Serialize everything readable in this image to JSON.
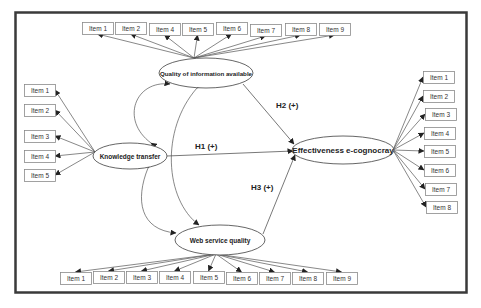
{
  "diagram": {
    "constructs": {
      "quality": {
        "label": "Quality of information available",
        "cx": 206,
        "cy": 73,
        "rx": 47,
        "ry": 15,
        "font_size": 6.2
      },
      "knowledge": {
        "label": "Knowledge transfer",
        "cx": 130,
        "cy": 156,
        "rx": 37,
        "ry": 13,
        "font_size": 6.5
      },
      "effectiveness": {
        "label": "Effectiveness e-cognocray",
        "cx": 343,
        "cy": 150,
        "rx": 51,
        "ry": 14,
        "font_size": 8
      },
      "web": {
        "label": "Web service quality",
        "cx": 220,
        "cy": 240,
        "rx": 45,
        "ry": 15,
        "font_size": 6.5
      }
    },
    "hypotheses": [
      {
        "id": "H1",
        "label": "H1 (+)",
        "lx": 195,
        "ly": 149
      },
      {
        "id": "H2",
        "label": "H2 (+)",
        "lx": 276,
        "ly": 108
      },
      {
        "id": "H3",
        "label": "H3 (+)",
        "lx": 251,
        "ly": 190
      }
    ],
    "quality_items": [
      {
        "label": "Item 1",
        "x": 82,
        "y": 22
      },
      {
        "label": "Item 2",
        "x": 115,
        "y": 22
      },
      {
        "label": "Item 4",
        "x": 149,
        "y": 23
      },
      {
        "label": "Item 5",
        "x": 182,
        "y": 23
      },
      {
        "label": "Item 6",
        "x": 216,
        "y": 22
      },
      {
        "label": "Item 7",
        "x": 250,
        "y": 24
      },
      {
        "label": "Item 8",
        "x": 285,
        "y": 23
      },
      {
        "label": "Item 9",
        "x": 319,
        "y": 23
      }
    ],
    "knowledge_items": [
      {
        "label": "Item 1",
        "x": 24,
        "y": 84
      },
      {
        "label": "Item 2",
        "x": 24,
        "y": 104
      },
      {
        "label": "Item 3",
        "x": 24,
        "y": 130
      },
      {
        "label": "Item 4",
        "x": 24,
        "y": 150
      },
      {
        "label": "Item 5",
        "x": 24,
        "y": 169
      }
    ],
    "effectiveness_items": [
      {
        "label": "Item 1",
        "x": 423,
        "y": 71
      },
      {
        "label": "Item 2",
        "x": 423,
        "y": 90
      },
      {
        "label": "Item 3",
        "x": 425,
        "y": 108
      },
      {
        "label": "Item 4",
        "x": 424,
        "y": 127
      },
      {
        "label": "Item 5",
        "x": 424,
        "y": 145
      },
      {
        "label": "Item 6",
        "x": 424,
        "y": 164
      },
      {
        "label": "Item 7",
        "x": 425,
        "y": 183
      },
      {
        "label": "Item 8",
        "x": 426,
        "y": 201
      }
    ],
    "web_items": [
      {
        "label": "Item 1",
        "x": 60,
        "y": 272
      },
      {
        "label": "Item 2",
        "x": 93,
        "y": 271
      },
      {
        "label": "Item 3",
        "x": 126,
        "y": 271
      },
      {
        "label": "Item 4",
        "x": 159,
        "y": 271
      },
      {
        "label": "Item 5",
        "x": 193,
        "y": 271
      },
      {
        "label": "Item 6",
        "x": 226,
        "y": 272
      },
      {
        "label": "Item 7",
        "x": 259,
        "y": 272
      },
      {
        "label": "Item 8",
        "x": 292,
        "y": 272
      },
      {
        "label": "Item 9",
        "x": 326,
        "y": 272
      }
    ],
    "colors": {
      "frame": "#3a3a3a",
      "line": "#555555",
      "box_border": "#8a8a8a",
      "text": "#222222"
    }
  }
}
